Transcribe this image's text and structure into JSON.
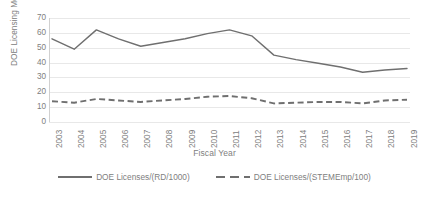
{
  "chart_data": {
    "type": "line",
    "title": "",
    "xlabel": "Fiscal Year",
    "ylabel": "DOE Licensing Meetrics",
    "categories": [
      "2003",
      "2004",
      "2005",
      "2006",
      "2007",
      "2008",
      "2009",
      "2010",
      "2011",
      "2012",
      "2013",
      "2014",
      "2015",
      "2016",
      "2017",
      "2018",
      "2019"
    ],
    "ylim": [
      0,
      70
    ],
    "ytick_labels": [
      "70",
      "60",
      "50",
      "40",
      "30",
      "20",
      "10",
      "0"
    ],
    "ytick_values": [
      70,
      60,
      50,
      40,
      30,
      20,
      10,
      0
    ],
    "grid": true,
    "legend_position": "bottom",
    "series": [
      {
        "name": "DOE Licenses/(RD/1000)",
        "style": "solid",
        "color": "#6f6f6f",
        "values": [
          56,
          49,
          62,
          56,
          51,
          53.5,
          56,
          59.5,
          62,
          58,
          45,
          42,
          39.5,
          37,
          33.5,
          35,
          36
        ]
      },
      {
        "name": "DOE Licenses/(STEMEmp/100)",
        "style": "dashed",
        "color": "#6f6f6f",
        "values": [
          14,
          13,
          15.5,
          14.5,
          13.5,
          14.5,
          15.5,
          17,
          17.5,
          16,
          12.5,
          13,
          13.5,
          13.5,
          12.5,
          14.5,
          15
        ]
      }
    ]
  }
}
